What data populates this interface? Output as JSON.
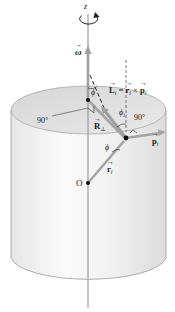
{
  "diagram": {
    "axis_label": "z",
    "omega_label": "ω",
    "angle_phi_top": "ϕ",
    "angle_phi_i": "ϕ",
    "angle_phi_i_sub": "i",
    "angle_phi_bottom": "ϕ",
    "right_angle_left": "90°",
    "right_angle_right": "90°",
    "L_label": "L",
    "L_sub": "i",
    "equation_eq": "=",
    "r_label_eq": "r",
    "r_sub_eq": "i",
    "cross": "×",
    "p_label_eq": "p",
    "p_sub_eq": "i",
    "R_label": "R",
    "R_sub": "⊥",
    "p_label": "p",
    "p_sub": "i",
    "r_label": "r",
    "r_sub": "i",
    "origin_label": "O",
    "colors": {
      "vector_gray": "#9a9a9a",
      "axis": "#8a8a8a",
      "cylinder_fill": "#f0f0f0",
      "cylinder_top": "#d9d9d9",
      "outline": "#9b9b9b",
      "text": "#222222",
      "dot": "#111111"
    }
  }
}
